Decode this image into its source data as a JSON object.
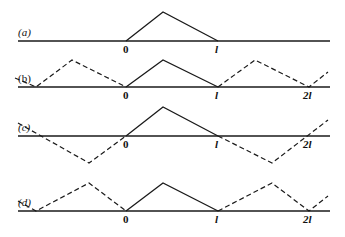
{
  "colors": {
    "ink": "#1a1a1a",
    "background": "#ffffff"
  },
  "panels": [
    {
      "id": "a",
      "label": "(a)",
      "baseline_y": 41,
      "baseline_x": [
        18,
        330
      ],
      "solid": [
        [
          126,
          41
        ],
        [
          163,
          12
        ],
        [
          218,
          41
        ]
      ],
      "dashed": [],
      "ticks": [
        {
          "text": "0",
          "x": 126
        },
        {
          "text": "l",
          "x": 218
        }
      ]
    },
    {
      "id": "b",
      "label": "(b)",
      "baseline_y": 87,
      "baseline_x": [
        18,
        330
      ],
      "solid": [
        [
          126,
          87
        ],
        [
          163,
          60
        ],
        [
          218,
          87
        ]
      ],
      "dashed": [
        [
          [
            15,
            78
          ],
          [
            36,
            87
          ],
          [
            72,
            60
          ],
          [
            126,
            87
          ]
        ],
        [
          [
            218,
            87
          ],
          [
            255,
            60
          ],
          [
            309,
            87
          ],
          [
            328,
            72
          ]
        ]
      ],
      "ticks": [
        {
          "text": "0",
          "x": 126
        },
        {
          "text": "l",
          "x": 218
        },
        {
          "text": "2l",
          "x": 309
        }
      ]
    },
    {
      "id": "c",
      "label": "(c)",
      "baseline_y": 136,
      "baseline_x": [
        18,
        330
      ],
      "solid": [
        [
          126,
          136
        ],
        [
          163,
          107
        ],
        [
          218,
          136
        ]
      ],
      "dashed": [
        [
          [
            18,
            123
          ],
          [
            89,
            163
          ],
          [
            126,
            136
          ]
        ],
        [
          [
            218,
            136
          ],
          [
            272,
            163
          ],
          [
            328,
            120
          ]
        ]
      ],
      "ticks": [
        {
          "text": "0",
          "x": 126
        },
        {
          "text": "l",
          "x": 218
        },
        {
          "text": "2l",
          "x": 309
        }
      ]
    },
    {
      "id": "d",
      "label": "(d)",
      "baseline_y": 211,
      "baseline_x": [
        18,
        330
      ],
      "solid": [
        [
          126,
          211
        ],
        [
          163,
          183
        ],
        [
          218,
          211
        ]
      ],
      "dashed": [
        [
          [
            18,
            201
          ],
          [
            36,
            211
          ],
          [
            89,
            183
          ],
          [
            126,
            211
          ]
        ],
        [
          [
            218,
            211
          ],
          [
            272,
            183
          ],
          [
            309,
            211
          ],
          [
            328,
            196
          ]
        ]
      ],
      "ticks": [
        {
          "text": "0",
          "x": 126
        },
        {
          "text": "l",
          "x": 218
        },
        {
          "text": "2l",
          "x": 309
        }
      ]
    }
  ]
}
